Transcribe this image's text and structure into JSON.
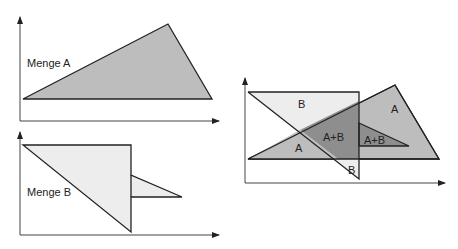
{
  "colors": {
    "set_a_fill": "#bdbdbd",
    "set_b_fill": "#ededed",
    "intersection_fill": "#8e8e8e",
    "stroke": "#222222",
    "axis": "#444444"
  },
  "panel_a": {
    "label": "Menge A"
  },
  "panel_b": {
    "label": "Menge B"
  },
  "panel_union": {
    "labels": {
      "b_top": "B",
      "a_right": "A",
      "a_left": "A",
      "overlap_main": "A+B",
      "overlap_small": "A+B",
      "b_bottom": "B"
    }
  }
}
